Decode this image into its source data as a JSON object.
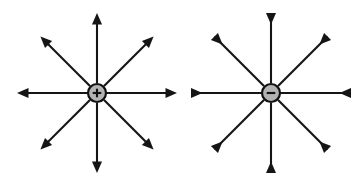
{
  "figure": {
    "background_color": "#ffffff",
    "width": 362,
    "height": 183,
    "line_color": "#151515",
    "charge_fill_color": "#b3b3b3",
    "charge_stroke_color": "#111111"
  },
  "diagrams": [
    {
      "id": "positive-charge-field",
      "label": "Positive point charge",
      "sign_symbol": "+",
      "sign_name": "plus-sign",
      "field_direction": "outward",
      "center": {
        "x": 97,
        "y": 93
      },
      "charge_radius": 9,
      "line_count": 8,
      "line_length": 80,
      "angles_deg": [
        0,
        45,
        90,
        135,
        180,
        225,
        270,
        315
      ],
      "arrow_position": "tip-outer-end"
    },
    {
      "id": "negative-charge-field",
      "label": "Negative point charge",
      "sign_symbol": "−",
      "sign_name": "minus-sign",
      "field_direction": "inward",
      "center": {
        "x": 271,
        "y": 93
      },
      "charge_radius": 9,
      "line_count": 8,
      "line_length": 80,
      "angles_deg": [
        0,
        45,
        90,
        135,
        180,
        225,
        270,
        315
      ],
      "arrow_position": "head-at-outer-end-pointing-inward"
    }
  ],
  "chart_data": {
    "type": "diagram",
    "xlabel": "",
    "ylabel": "",
    "series": [
      {
        "name": "Positive charge field lines",
        "charge": "+",
        "center": [
          97,
          93
        ],
        "values": [
          0,
          45,
          90,
          135,
          180,
          225,
          270,
          315
        ],
        "direction": "outward"
      },
      {
        "name": "Negative charge field lines",
        "charge": "−",
        "center": [
          271,
          93
        ],
        "values": [
          0,
          45,
          90,
          135,
          180,
          225,
          270,
          315
        ],
        "direction": "inward"
      }
    ],
    "legend": [],
    "grid": false
  }
}
